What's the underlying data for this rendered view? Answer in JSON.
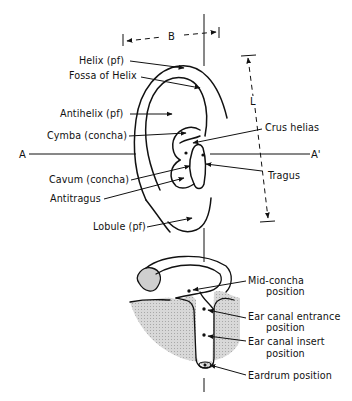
{
  "figure": {
    "colors": {
      "ink": "#111111",
      "shading": "#cfcfcf",
      "background": "#ffffff"
    }
  },
  "dimensions": {
    "breadth_label": "B",
    "length_label": "L",
    "axis_left_label": "A",
    "axis_right_label": "A'"
  },
  "ear_labels": {
    "left": [
      {
        "id": "helix",
        "text": "Helix (pf)"
      },
      {
        "id": "fossa_of_helix",
        "text": "Fossa of Helix"
      },
      {
        "id": "antihelix",
        "text": "Antihelix (pf)"
      },
      {
        "id": "cymba",
        "text": "Cymba (concha)"
      },
      {
        "id": "cavum",
        "text": "Cavum (concha)"
      },
      {
        "id": "antitragus",
        "text": "Antitragus"
      },
      {
        "id": "lobule",
        "text": "Lobule (pf)"
      }
    ],
    "right": [
      {
        "id": "crus_helias",
        "text": "Crus helias"
      },
      {
        "id": "tragus",
        "text": "Tragus"
      }
    ]
  },
  "canal_labels": [
    {
      "id": "mid_concha",
      "line1": "Mid-concha",
      "line2": "position"
    },
    {
      "id": "canal_entrance",
      "line1": "Ear canal entrance",
      "line2": "position"
    },
    {
      "id": "canal_insert",
      "line1": "Ear canal insert",
      "line2": "position"
    },
    {
      "id": "eardrum",
      "line1": "Eardrum position",
      "line2": ""
    }
  ]
}
